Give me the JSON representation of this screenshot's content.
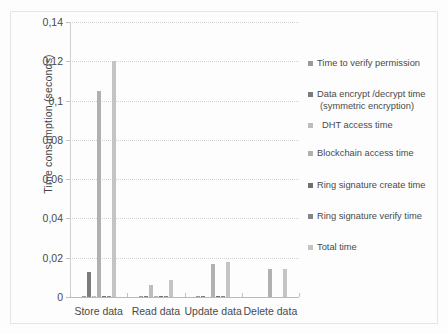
{
  "chart_data": {
    "type": "bar",
    "title": "",
    "subtitle": "",
    "xlabel": "",
    "ylabel": "Time consumption (seconds)",
    "categories": [
      "Store data",
      "Read data",
      "Update data",
      "Delete data"
    ],
    "ylim": [
      0,
      0.14
    ],
    "ytick_labels": [
      "0",
      "0,02",
      "0,04",
      "0,06",
      "0,08",
      "0,1",
      "0,12",
      "0,14"
    ],
    "ytick_values": [
      0,
      0.02,
      0.04,
      0.06,
      0.08,
      0.1,
      0.12,
      0.14
    ],
    "grid": true,
    "legend_position": "right",
    "decimal_separator": ",",
    "series": [
      {
        "name": "Time to verify permission",
        "color": "#9a9a9a",
        "values": [
          0.0004,
          0.0004,
          0.0004,
          0.0
        ]
      },
      {
        "name": "Data encrypt /decrypt time",
        "name_line2": "(symmetric encryption)",
        "color": "#7b7b7b",
        "values": [
          0.0128,
          0.0006,
          0.0004,
          0.0
        ]
      },
      {
        "name": "DHT access time",
        "color": "#bdbdbd",
        "values": [
          0.0004,
          0.006,
          0.0,
          0.0
        ]
      },
      {
        "name": "Blockchain access time",
        "color": "#b0b0b0",
        "values": [
          0.105,
          0.0007,
          0.0166,
          0.0144
        ]
      },
      {
        "name": "Ring signature create time",
        "color": "#707070",
        "values": [
          0.0003,
          0.0004,
          0.0004,
          0.0
        ]
      },
      {
        "name": "Ring signature verify time",
        "color": "#858585",
        "values": [
          0.0002,
          0.0002,
          0.0002,
          0.0
        ]
      },
      {
        "name": "Total time",
        "color": "#c4c4c4",
        "values": [
          0.12,
          0.0085,
          0.0176,
          0.0143
        ]
      }
    ]
  },
  "legend": {
    "items": [
      {
        "label": "Time to verify permission",
        "label2": "",
        "swatch": "#9a9a9a",
        "top": 0,
        "indent": false
      },
      {
        "label": "Data encrypt /decrypt time",
        "label2": "(symmetric encryption)",
        "swatch": "#7b7b7b",
        "top": 31,
        "indent": false
      },
      {
        "label": "DHT access time",
        "label2": "",
        "swatch": "#bdbdbd",
        "top": 62,
        "indent": true
      },
      {
        "label": "Blockchain access time",
        "label2": "",
        "swatch": "#b0b0b0",
        "top": 90,
        "indent": false
      },
      {
        "label": "Ring signature create time",
        "label2": "",
        "swatch": "#707070",
        "top": 122,
        "indent": false
      },
      {
        "label": "Ring signature verify time",
        "label2": "",
        "swatch": "#858585",
        "top": 153,
        "indent": false
      },
      {
        "label": "Total time",
        "label2": "",
        "swatch": "#c4c4c4",
        "top": 184,
        "indent": false
      }
    ]
  }
}
